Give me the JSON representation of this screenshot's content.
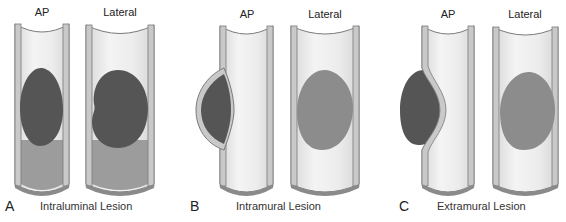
{
  "panels": [
    {
      "letter": "A",
      "caption": "Intraluminal Lesion",
      "views": [
        {
          "label": "AP"
        },
        {
          "label": "Lateral"
        }
      ]
    },
    {
      "letter": "B",
      "caption": "Intramural Lesion",
      "views": [
        {
          "label": "AP"
        },
        {
          "label": "Lateral"
        }
      ]
    },
    {
      "letter": "C",
      "caption": "Extramural Lesion",
      "views": [
        {
          "label": "AP"
        },
        {
          "label": "Lateral"
        }
      ]
    }
  ],
  "colors": {
    "tube_interior": "#ececec",
    "tube_wall": "#c9c9c9",
    "tube_outline": "#7a7a7a",
    "lesion_dark": "#555555",
    "lesion_lateral": "#8c8c8c",
    "contrast_fluid": "#9c9c9c"
  }
}
